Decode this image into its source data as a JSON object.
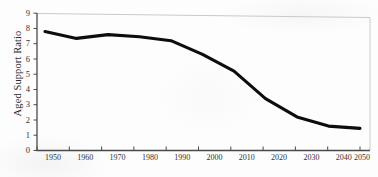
{
  "figure": {
    "background_color": "#fdfdfd",
    "line_color": "#0d0d0d",
    "axis_color": "#4a4a4a",
    "plot_border_color": "#c9c9c9",
    "tick_label_color": "#333333"
  },
  "chart_data": {
    "type": "line",
    "title": "",
    "subtitle": "",
    "xlabel": "",
    "ylabel": "Aged Support Ratio",
    "x": [
      1950,
      1960,
      1970,
      1980,
      1990,
      2000,
      2010,
      2020,
      2030,
      2040,
      2050
    ],
    "values": [
      7.8,
      7.35,
      7.6,
      7.45,
      7.2,
      6.3,
      5.2,
      3.4,
      2.2,
      1.6,
      1.45
    ],
    "series": [
      {
        "name": "Aged Support Ratio",
        "values": [
          7.8,
          7.35,
          7.6,
          7.45,
          7.2,
          6.3,
          5.2,
          3.4,
          2.2,
          1.6,
          1.45
        ]
      }
    ],
    "xlim": [
      1945,
      2055
    ],
    "ylim": [
      0,
      9
    ],
    "ytick_labels": [
      "0",
      "1",
      "2",
      "3",
      "4",
      "5",
      "6",
      "7",
      "8",
      "9"
    ],
    "ytick_values": [
      0,
      1,
      2,
      3,
      4,
      5,
      6,
      7,
      8,
      9
    ],
    "xtick_labels": [
      "1950",
      "1960",
      "1970",
      "1980",
      "1990",
      "2000",
      "2010",
      "2020",
      "2030",
      "2040",
      "2050"
    ],
    "xtick_values": [
      1950,
      1960,
      1970,
      1980,
      1990,
      2000,
      2010,
      2020,
      2030,
      2040,
      2050
    ],
    "grid": false,
    "legend": false,
    "legend_position": "none",
    "annotations": []
  }
}
